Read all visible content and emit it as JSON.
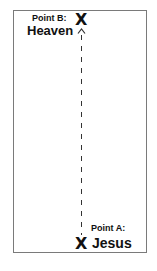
{
  "diagram": {
    "point_b": {
      "label": "Point B:",
      "name": "Heaven",
      "marker": "X"
    },
    "point_a": {
      "label": "Point A:",
      "name": "Jesus",
      "marker": "X"
    },
    "connector": {
      "style": "dashed",
      "direction": "up",
      "from": "Point A",
      "to": "Point B"
    }
  }
}
